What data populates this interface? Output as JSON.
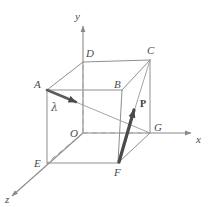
{
  "figure": {
    "background_color": "#ffffff",
    "line_color": "#8a8a8a",
    "dashed_color": "#a0a0a0",
    "vector_color": "#4a4a4a",
    "label_color": "#4a4a4a"
  },
  "axes": {
    "x": {
      "label": "x",
      "label_x": 196,
      "label_y": 143
    },
    "y": {
      "label": "y",
      "label_x": 75,
      "label_y": 20
    },
    "z": {
      "label": "z",
      "label_x": 6,
      "label_y": 202
    }
  },
  "vertices": [
    {
      "id": "A",
      "label": "A",
      "px": 47,
      "py": 90,
      "label_x": 34,
      "label_y": 88
    },
    {
      "id": "B",
      "label": "B",
      "px": 122,
      "py": 90,
      "label_x": 114,
      "label_y": 88
    },
    {
      "id": "C",
      "label": "C",
      "px": 150,
      "py": 60,
      "label_x": 147,
      "label_y": 54
    },
    {
      "id": "D",
      "label": "D",
      "px": 83,
      "py": 62,
      "label_x": 86,
      "label_y": 57
    },
    {
      "id": "E",
      "label": "E",
      "px": 47,
      "py": 163,
      "label_x": 34,
      "label_y": 167
    },
    {
      "id": "F",
      "label": "F",
      "px": 118,
      "py": 163,
      "label_x": 114,
      "label_y": 176
    },
    {
      "id": "G",
      "label": "G",
      "px": 150,
      "py": 133,
      "label_x": 154,
      "label_y": 131
    },
    {
      "id": "O",
      "label": "O",
      "px": 83,
      "py": 133,
      "label_x": 70,
      "label_y": 137
    }
  ],
  "vectors": [
    {
      "id": "vector-from-A",
      "label": "λ",
      "label_x": 51,
      "label_y": 111,
      "from": {
        "x": 47,
        "y": 90
      },
      "to": {
        "x": 80,
        "y": 104
      }
    },
    {
      "id": "vector-from-F",
      "label": "P",
      "label_x": 141,
      "label_y": 106,
      "from": {
        "x": 119,
        "y": 162
      },
      "to": {
        "x": 136,
        "y": 104
      }
    }
  ],
  "edges": {
    "solid": "cube edges drawn as solid thin lines",
    "hidden": "edges through origin O drawn dashed",
    "diagonal": "face diagonal from A to G"
  }
}
